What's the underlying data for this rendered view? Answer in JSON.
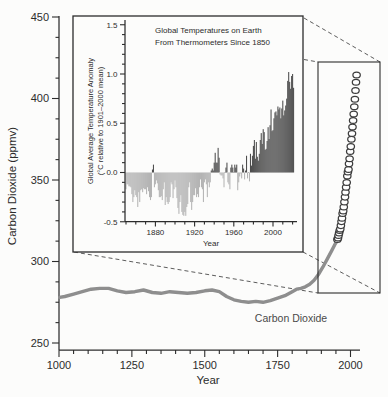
{
  "figure": {
    "bg": "#fcfcfb",
    "main": {
      "ylabel": "Carbon Dioxide (ppmv)",
      "xlabel": "Year",
      "curve_label": "Carbon Dioxide"
    },
    "inset": {
      "title_line1": "Global Temperatures on Earth",
      "title_line2": "From Thermometers Since 1850",
      "ylabel_line1": "Global Average Temperature Anomaly",
      "ylabel_line2": "(°C relative to 1901–2000 mean)",
      "xlabel": "Year"
    },
    "colors": {
      "co2_line": "#8e8e8e",
      "circle_stroke": "#3c3c3c",
      "positive_bar": "#4c4c4c",
      "negative_bar": "#b4b4b4",
      "axis": "#2c2c2c"
    }
  },
  "chart_data": [
    {
      "id": "co2-main",
      "type": "line",
      "xlabel": "Year",
      "ylabel": "Carbon Dioxide (ppmv)",
      "xlim": [
        1000,
        2035
      ],
      "ylim": [
        250,
        450
      ],
      "x_ticks": [
        1000,
        1250,
        1500,
        1750,
        2000
      ],
      "y_ticks": [
        250,
        300,
        350,
        400,
        450
      ],
      "annotation": "Carbon Dioxide",
      "legend": "none",
      "grid": false,
      "series": [
        {
          "name": "Ice-core CO2 (smoothed thick gray line)",
          "style": "thick-gray-line",
          "points": [
            [
              1002,
              278
            ],
            [
              1020,
              278.5
            ],
            [
              1050,
              280
            ],
            [
              1080,
              281.5
            ],
            [
              1110,
              283
            ],
            [
              1140,
              283.5
            ],
            [
              1170,
              283.5
            ],
            [
              1200,
              282
            ],
            [
              1230,
              281
            ],
            [
              1260,
              281.5
            ],
            [
              1290,
              282.5
            ],
            [
              1320,
              281
            ],
            [
              1350,
              280.5
            ],
            [
              1380,
              281.5
            ],
            [
              1410,
              281
            ],
            [
              1440,
              280.5
            ],
            [
              1470,
              281
            ],
            [
              1500,
              282
            ],
            [
              1525,
              282.5
            ],
            [
              1550,
              281.5
            ],
            [
              1575,
              278.5
            ],
            [
              1600,
              276.5
            ],
            [
              1625,
              275.5
            ],
            [
              1650,
              275
            ],
            [
              1675,
              275.5
            ],
            [
              1700,
              275
            ],
            [
              1725,
              276
            ],
            [
              1750,
              277.5
            ],
            [
              1775,
              279
            ],
            [
              1800,
              281.5
            ],
            [
              1815,
              283
            ],
            [
              1830,
              283.5
            ],
            [
              1845,
              284.5
            ],
            [
              1860,
              286
            ],
            [
              1875,
              288.5
            ],
            [
              1890,
              292
            ],
            [
              1905,
              296.5
            ],
            [
              1920,
              301.5
            ],
            [
              1935,
              306.5
            ],
            [
              1945,
              310
            ],
            [
              1955,
              313
            ]
          ]
        },
        {
          "name": "Measured atmospheric CO2 (open circles)",
          "style": "open-circles",
          "points": [
            [
              1955,
              313.5
            ],
            [
              1957,
              314.5
            ],
            [
              1959,
              316
            ],
            [
              1961,
              317.5
            ],
            [
              1963,
              319
            ],
            [
              1965,
              320
            ],
            [
              1967,
              322
            ],
            [
              1969,
              324.5
            ],
            [
              1971,
              326.5
            ],
            [
              1973,
              329.5
            ],
            [
              1975,
              331
            ],
            [
              1977,
              333.5
            ],
            [
              1979,
              336.5
            ],
            [
              1981,
              339.5
            ],
            [
              1983,
              342.5
            ],
            [
              1985,
              345.5
            ],
            [
              1987,
              348.5
            ],
            [
              1989,
              352.5
            ],
            [
              1991,
              355
            ],
            [
              1993,
              356.5
            ],
            [
              1995,
              360
            ],
            [
              1997,
              363
            ],
            [
              1999,
              367.5
            ],
            [
              2001,
              370.5
            ],
            [
              2003,
              375
            ],
            [
              2005,
              378.5
            ],
            [
              2007,
              382.5
            ],
            [
              2009,
              386.5
            ],
            [
              2011,
              390.5
            ],
            [
              2013,
              395
            ],
            [
              2015,
              399.5
            ],
            [
              2017,
              405
            ],
            [
              2019,
              410
            ],
            [
              2021,
              414.5
            ]
          ]
        }
      ]
    },
    {
      "id": "temperature-inset",
      "type": "bar",
      "title": "Global Temperatures on Earth From Thermometers Since 1850",
      "xlabel": "Year",
      "ylabel": "Global Average Temperature Anomaly (°C relative to 1901–2000 mean)",
      "xlim": [
        1848,
        2024
      ],
      "ylim": [
        -0.5,
        1.5
      ],
      "x_ticks": [
        1880,
        1920,
        1960,
        2000
      ],
      "y_ticks": [
        -0.5,
        0,
        0.5,
        1,
        1.5
      ],
      "grid": false,
      "positive_color": "#4c4c4c",
      "negative_color": "#b4b4b4",
      "start_year": 1850,
      "values": [
        -0.17,
        -0.12,
        -0.12,
        -0.14,
        -0.14,
        -0.15,
        -0.22,
        -0.3,
        -0.25,
        -0.18,
        -0.23,
        -0.25,
        -0.35,
        -0.2,
        -0.3,
        -0.18,
        -0.17,
        -0.2,
        -0.16,
        -0.17,
        -0.17,
        -0.22,
        -0.15,
        -0.19,
        -0.25,
        -0.28,
        -0.25,
        0.03,
        0.08,
        -0.15,
        -0.12,
        -0.08,
        -0.11,
        -0.18,
        -0.25,
        -0.25,
        -0.24,
        -0.28,
        -0.17,
        -0.1,
        -0.33,
        -0.25,
        -0.3,
        -0.32,
        -0.3,
        -0.25,
        -0.1,
        -0.12,
        -0.26,
        -0.17,
        -0.08,
        -0.15,
        -0.26,
        -0.36,
        -0.42,
        -0.3,
        -0.23,
        -0.4,
        -0.43,
        -0.44,
        -0.4,
        -0.44,
        -0.35,
        -0.32,
        -0.15,
        -0.1,
        -0.3,
        -0.38,
        -0.3,
        -0.23,
        -0.23,
        -0.16,
        -0.25,
        -0.22,
        -0.25,
        -0.15,
        -0.07,
        -0.15,
        -0.17,
        -0.3,
        -0.1,
        -0.07,
        -0.12,
        -0.25,
        -0.1,
        -0.15,
        -0.1,
        0.02,
        0.04,
        0.02,
        0.1,
        0.2,
        0.1,
        0.1,
        0.25,
        0.15,
        -0.02,
        -0.03,
        -0.03,
        -0.06,
        -0.15,
        0.0,
        0.05,
        0.1,
        -0.1,
        -0.12,
        -0.17,
        0.05,
        0.08,
        0.05,
        0.0,
        0.08,
        0.05,
        0.08,
        -0.18,
        -0.1,
        -0.04,
        -0.01,
        -0.06,
        0.08,
        0.04,
        -0.07,
        0.02,
        0.17,
        -0.06,
        0.0,
        -0.09,
        0.19,
        0.07,
        0.17,
        0.27,
        0.33,
        0.14,
        0.31,
        0.16,
        0.12,
        0.19,
        0.33,
        0.4,
        0.29,
        0.44,
        0.41,
        0.23,
        0.24,
        0.32,
        0.46,
        0.34,
        0.48,
        0.64,
        0.42,
        0.43,
        0.55,
        0.61,
        0.62,
        0.58,
        0.67,
        0.64,
        0.66,
        0.55,
        0.65,
        0.73,
        0.58,
        0.63,
        0.68,
        0.75,
        0.93,
        1.02,
        0.92,
        0.85,
        0.98,
        1.0,
        0.86
      ]
    }
  ]
}
